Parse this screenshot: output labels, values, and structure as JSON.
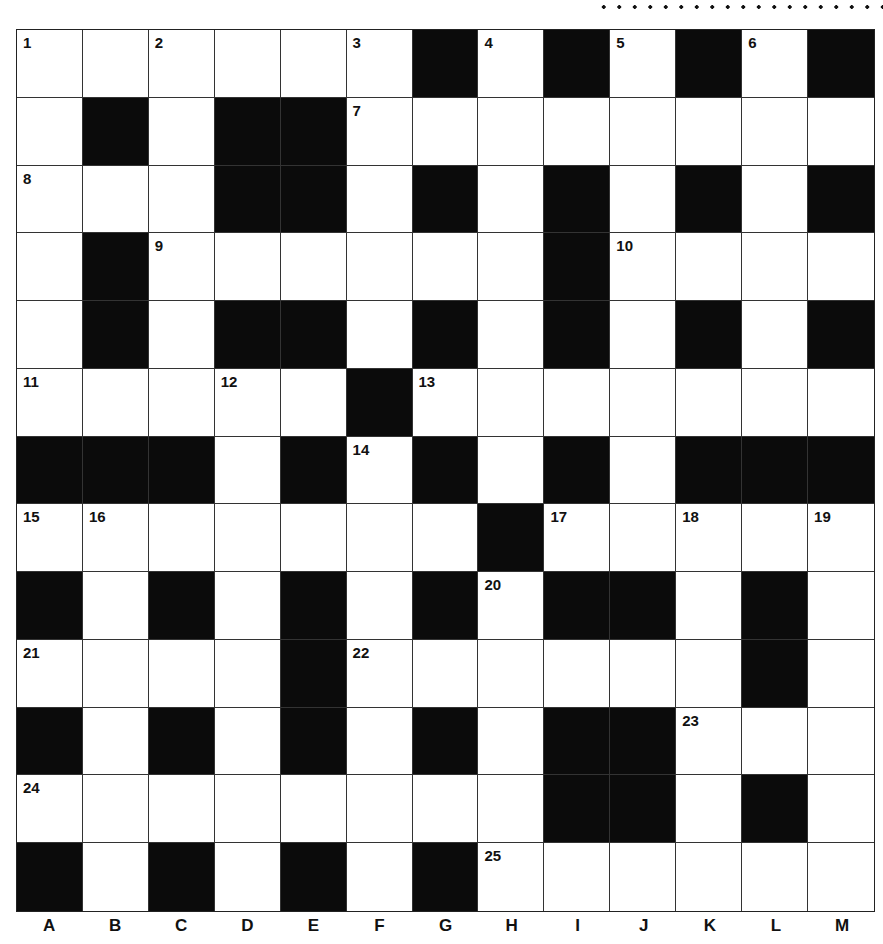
{
  "puzzle": {
    "rows": 13,
    "cols": 13,
    "grid": [
      "WWWWWWBWBWBWB",
      "WBWBBWWWWWWWW",
      "WWWBBWBWBWBWB",
      "WBWWWWWWBWWWW",
      "WBWBBWBWBWBWB",
      "WWWWWBWWWWWWW",
      "BBBWBWBWBWBBB",
      "WWWWWWWBWWWWW",
      "BWBWBWBWBBWBW",
      "WWWWBWWWWWWBW",
      "BWBWBWBWBBWWW",
      "WWWWWWWWBBWBW",
      "BWBWBWBWWWWWW"
    ],
    "numbers": [
      {
        "r": 0,
        "c": 0,
        "n": "1"
      },
      {
        "r": 0,
        "c": 2,
        "n": "2"
      },
      {
        "r": 0,
        "c": 5,
        "n": "3"
      },
      {
        "r": 0,
        "c": 7,
        "n": "4"
      },
      {
        "r": 0,
        "c": 9,
        "n": "5"
      },
      {
        "r": 0,
        "c": 11,
        "n": "6"
      },
      {
        "r": 1,
        "c": 5,
        "n": "7"
      },
      {
        "r": 2,
        "c": 0,
        "n": "8"
      },
      {
        "r": 3,
        "c": 2,
        "n": "9"
      },
      {
        "r": 3,
        "c": 9,
        "n": "10"
      },
      {
        "r": 5,
        "c": 0,
        "n": "11"
      },
      {
        "r": 5,
        "c": 3,
        "n": "12"
      },
      {
        "r": 5,
        "c": 6,
        "n": "13"
      },
      {
        "r": 6,
        "c": 5,
        "n": "14"
      },
      {
        "r": 7,
        "c": 0,
        "n": "15"
      },
      {
        "r": 7,
        "c": 1,
        "n": "16"
      },
      {
        "r": 7,
        "c": 8,
        "n": "17"
      },
      {
        "r": 7,
        "c": 10,
        "n": "18"
      },
      {
        "r": 7,
        "c": 12,
        "n": "19"
      },
      {
        "r": 8,
        "c": 7,
        "n": "20"
      },
      {
        "r": 9,
        "c": 0,
        "n": "21"
      },
      {
        "r": 9,
        "c": 5,
        "n": "22"
      },
      {
        "r": 10,
        "c": 10,
        "n": "23"
      },
      {
        "r": 11,
        "c": 0,
        "n": "24"
      },
      {
        "r": 12,
        "c": 7,
        "n": "25"
      }
    ],
    "column_labels": [
      "A",
      "B",
      "C",
      "D",
      "E",
      "F",
      "G",
      "H",
      "I",
      "J",
      "K",
      "L",
      "M"
    ]
  },
  "colors": {
    "black_cell": "#0b0b0b",
    "white_cell": "#ffffff",
    "line": "#333333"
  }
}
